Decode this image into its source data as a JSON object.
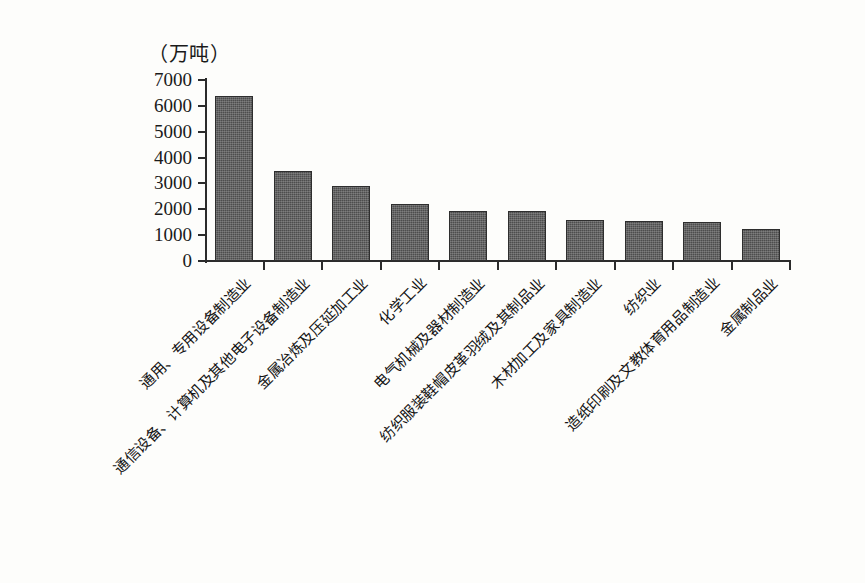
{
  "figure": {
    "unit_caption": "（万吨）"
  },
  "chart_data": {
    "type": "bar",
    "title": "",
    "subtitle": "",
    "xlabel": "",
    "ylabel": "（万吨）",
    "ylim": [
      0,
      7000
    ],
    "grid": false,
    "legend": false,
    "orientation": "vertical",
    "yticks": [
      0,
      1000,
      2000,
      3000,
      4000,
      5000,
      6000,
      7000
    ],
    "ytick_labels": [
      "0",
      "1000",
      "2000",
      "3000",
      "4000",
      "5000",
      "6000",
      "7000"
    ],
    "categories": [
      "通用、专用设备制造业",
      "通信设备、计算机及其他电子设备制造业",
      "金属冶炼及压延加工业",
      "化学工业",
      "电气机械及器材制造业",
      "纺织服装鞋帽皮革羽绒及其制品业",
      "木材加工及家具制造业",
      "纺织业",
      "造纸印刷及文教体育用品制造业",
      "金属制品业"
    ],
    "values": [
      6400,
      3500,
      2900,
      2200,
      1950,
      1950,
      1600,
      1550,
      1500,
      1250
    ],
    "series": [
      {
        "name": "产量",
        "values": [
          6400,
          3500,
          2900,
          2200,
          1950,
          1950,
          1600,
          1550,
          1500,
          1250
        ]
      }
    ],
    "bar_color": "#4d4d4d",
    "bar_edge_color": "#2e2e2e",
    "axis_color": "#2b2b2b",
    "background_color": "#fdfdfb"
  }
}
